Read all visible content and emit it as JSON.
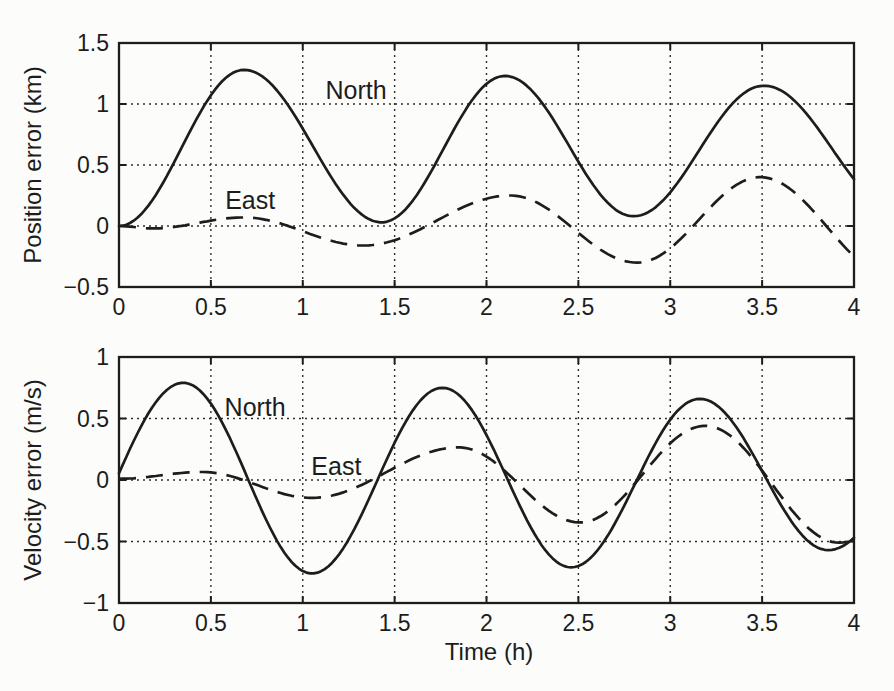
{
  "figure": {
    "paper_color": "#fcfcfa",
    "ink_color": "#1d1d1d",
    "grid_color": "#2f2f2f"
  },
  "chart_data": [
    {
      "type": "line",
      "title": "",
      "xlabel": "",
      "ylabel": "Position error (km)",
      "xlim": [
        0,
        4
      ],
      "ylim": [
        -0.5,
        1.5
      ],
      "xticks": [
        0,
        0.5,
        1,
        1.5,
        2,
        2.5,
        3,
        3.5,
        4
      ],
      "xtick_labels": [
        "0",
        "0.5",
        "1",
        "1.5",
        "2",
        "2.5",
        "3",
        "3.5",
        "4"
      ],
      "yticks": [
        -0.5,
        0,
        0.5,
        1,
        1.5
      ],
      "ytick_labels": [
        "−0.5",
        "0",
        "0.5",
        "1",
        "1.5"
      ],
      "grid": true,
      "legend": "inline labels next to curves",
      "interpolation": "half-cosine between successive extrema keypoints [t_hours, value]",
      "series": [
        {
          "name": "North",
          "style": "solid",
          "annotation": {
            "x": 1.29,
            "y": 1.115
          },
          "extrema": [
            [
              0,
              0
            ],
            [
              0.68,
              1.28
            ],
            [
              1.43,
              0.03
            ],
            [
              2.1,
              1.23
            ],
            [
              2.8,
              0.08
            ],
            [
              3.51,
              1.15
            ],
            [
              4.25,
              0.12
            ]
          ]
        },
        {
          "name": "East",
          "style": "dashed",
          "annotation": {
            "x": 0.714,
            "y": 0.213
          },
          "extrema": [
            [
              0,
              0
            ],
            [
              0.18,
              -0.02
            ],
            [
              0.68,
              0.07
            ],
            [
              1.33,
              -0.16
            ],
            [
              2.13,
              0.25
            ],
            [
              2.82,
              -0.3
            ],
            [
              3.49,
              0.4
            ],
            [
              4.22,
              -0.42
            ]
          ]
        }
      ]
    },
    {
      "type": "line",
      "title": "",
      "xlabel": "Time (h)",
      "ylabel": "Velocity error (m/s)",
      "xlim": [
        0,
        4
      ],
      "ylim": [
        -1,
        1
      ],
      "xticks": [
        0,
        0.5,
        1,
        1.5,
        2,
        2.5,
        3,
        3.5,
        4
      ],
      "xtick_labels": [
        "0",
        "0.5",
        "1",
        "1.5",
        "2",
        "2.5",
        "3",
        "3.5",
        "4"
      ],
      "yticks": [
        -1,
        -0.5,
        0,
        0.5,
        1
      ],
      "ytick_labels": [
        "−1",
        "−0.5",
        "0",
        "0.5",
        "1"
      ],
      "grid": true,
      "legend": "inline labels next to curves",
      "interpolation": "half-cosine between successive extrema keypoints [t_hours, value]",
      "series": [
        {
          "name": "North",
          "style": "solid",
          "annotation": {
            "x": 0.741,
            "y": 0.593
          },
          "extrema": [
            [
              -0.38,
              -0.78
            ],
            [
              0.35,
              0.79
            ],
            [
              1.05,
              -0.76
            ],
            [
              1.76,
              0.75
            ],
            [
              2.46,
              -0.71
            ],
            [
              3.16,
              0.66
            ],
            [
              3.86,
              -0.57
            ],
            [
              4.56,
              0.48
            ]
          ]
        },
        {
          "name": "East",
          "style": "dashed",
          "annotation": {
            "x": 1.183,
            "y": 0.114
          },
          "extrema": [
            [
              0,
              0.01
            ],
            [
              0.45,
              0.065
            ],
            [
              1.05,
              -0.145
            ],
            [
              1.85,
              0.265
            ],
            [
              2.51,
              -0.345
            ],
            [
              3.19,
              0.44
            ],
            [
              3.92,
              -0.51
            ],
            [
              4.6,
              0.4
            ]
          ]
        }
      ]
    }
  ]
}
